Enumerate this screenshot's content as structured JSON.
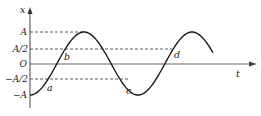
{
  "diagram": {
    "type": "displacement-time graph (simple harmonic motion)",
    "axes": {
      "y_label": "x",
      "x_label": "t",
      "y_ticks": [
        {
          "label": "A",
          "value": 1
        },
        {
          "label": "A/2",
          "value": 0.5
        },
        {
          "label": "O",
          "value": 0
        },
        {
          "label": "-A/2",
          "value": -0.5
        },
        {
          "label": "-A",
          "value": -1
        }
      ]
    },
    "points": [
      {
        "label": "a",
        "level": "-A/2"
      },
      {
        "label": "b",
        "level": "A/2"
      },
      {
        "label": "c",
        "level": "-A/2"
      },
      {
        "label": "d",
        "level": "A/2"
      }
    ],
    "colors": {
      "curve": "#1a1a1a",
      "axis": "#555555",
      "dashed": "#333333"
    }
  }
}
